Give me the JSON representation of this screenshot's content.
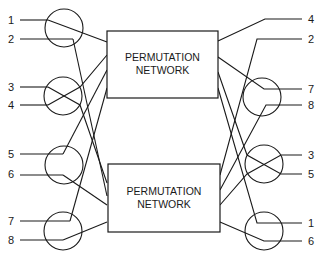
{
  "diagram": {
    "boxes": [
      {
        "id": "upper",
        "line1": "PERMUTATION",
        "line2": "NETWORK"
      },
      {
        "id": "lower",
        "line1": "PERMUTATION",
        "line2": "NETWORK"
      }
    ],
    "inputs": [
      "1",
      "2",
      "3",
      "4",
      "5",
      "6",
      "7",
      "8"
    ],
    "outputs": [
      "4",
      "2",
      "7",
      "8",
      "3",
      "5",
      "1",
      "6"
    ],
    "switch_states": {
      "left": [
        "straight",
        "cross",
        "straight",
        "straight"
      ],
      "right": [
        "straight",
        "straight",
        "cross",
        "straight"
      ]
    },
    "colors": {
      "stroke": "#1a1a1a",
      "background": "#ffffff"
    }
  }
}
